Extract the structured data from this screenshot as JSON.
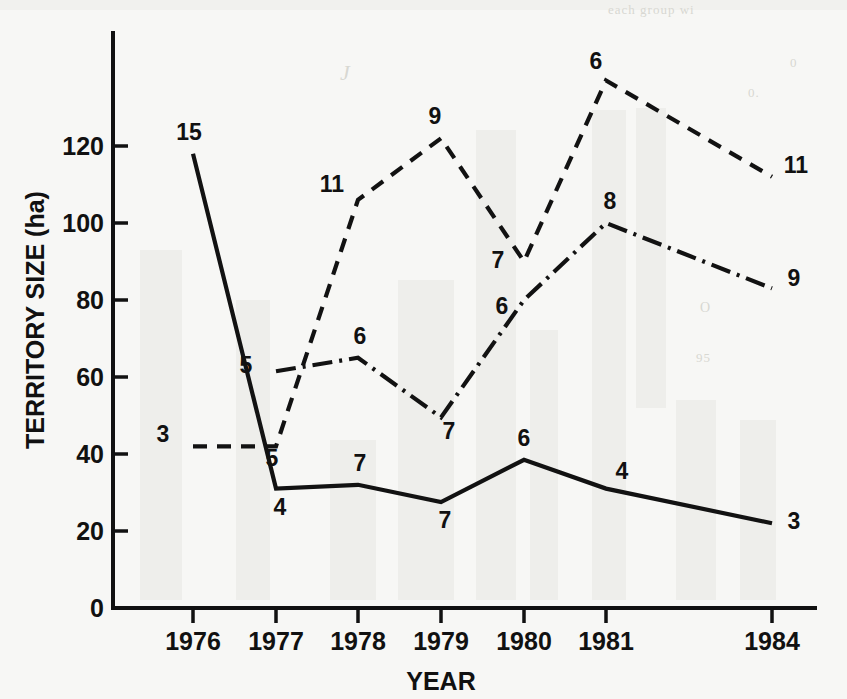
{
  "chart_data": {
    "type": "line",
    "title": "",
    "xlabel": "YEAR",
    "ylabel": "TERRITORY SIZE (ha)",
    "grid": false,
    "legend": "none",
    "x": [
      "1976",
      "1977",
      "1978",
      "1979",
      "1980",
      "1981",
      "1984"
    ],
    "xtick_labels": [
      "1976",
      "1977",
      "1978",
      "1979",
      "1980",
      "1981",
      "1984"
    ],
    "ytick_labels": [
      "0",
      "20",
      "40",
      "60",
      "80",
      "100",
      "120"
    ],
    "ytick_values": [
      0,
      20,
      40,
      60,
      80,
      100,
      120
    ],
    "ylim": [
      0,
      137
    ],
    "xlim_note": "categorical with gap between 1981 and 1984 (1982-83 missing)",
    "units": "ha",
    "point_label_meaning": "sample size (n) annotated at each plotted point",
    "series": [
      {
        "name": "solid-line-series",
        "style": "solid",
        "x": [
          "1976",
          "1977",
          "1978",
          "1979",
          "1980",
          "1981",
          "1984"
        ],
        "values": [
          118,
          31,
          32,
          27.5,
          38.5,
          31,
          22
        ],
        "point_labels": [
          "15",
          "4",
          "7",
          "7",
          "6",
          "4",
          "3"
        ]
      },
      {
        "name": "dashed-line-series",
        "style": "dashed",
        "x": [
          "1976",
          "1977",
          "1978",
          "1979",
          "1980",
          "1981",
          "1984"
        ],
        "values": [
          42,
          42,
          106,
          122,
          90,
          137,
          112
        ],
        "point_labels": [
          "3",
          "5",
          "11",
          "9",
          "7",
          "6",
          "11"
        ]
      },
      {
        "name": "dash-dot-line-series",
        "style": "dash-dot",
        "x": [
          "1977",
          "1978",
          "1979",
          "1980",
          "1981",
          "1984"
        ],
        "values": [
          61.5,
          65,
          49.5,
          80,
          100,
          83
        ],
        "point_labels": [
          "5",
          "6",
          "7",
          "6",
          "8",
          "9"
        ]
      }
    ]
  },
  "axes": {
    "y_title": "TERRITORY SIZE (ha)",
    "x_title": "YEAR"
  }
}
